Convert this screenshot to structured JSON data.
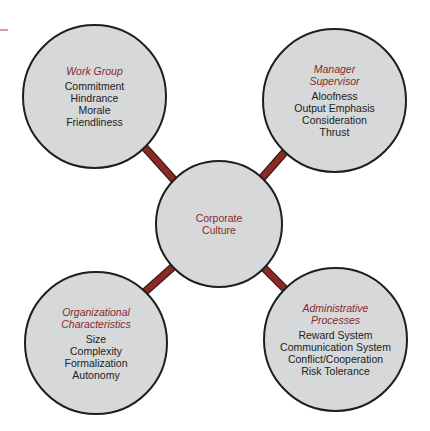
{
  "colors": {
    "connector": "#8b2a22",
    "circle_fill": "#d6d8da",
    "circle_border": "#1e1e1e",
    "title_text": "#8a2a2a",
    "item_text": "#222222"
  },
  "center": {
    "title_lines": [
      "Corporate",
      "Culture"
    ]
  },
  "nodes": {
    "work_group": {
      "title_lines": [
        "Work Group"
      ],
      "items": [
        "Commitment",
        "Hindrance",
        "Morale",
        "Friendliness"
      ]
    },
    "manager_supervisor": {
      "title_lines": [
        "Manager",
        "Supervisor"
      ],
      "items": [
        "Aloofness",
        "Output Emphasis",
        "Consideration",
        "Thrust"
      ]
    },
    "organizational_characteristics": {
      "title_lines": [
        "Organizational",
        "Characteristics"
      ],
      "items": [
        "Size",
        "Complexity",
        "Formalization",
        "Autonomy"
      ]
    },
    "administrative_processes": {
      "title_lines": [
        "Administrative",
        "Processes"
      ],
      "items": [
        "Reward System",
        "Communication System",
        "Conflict/Cooperation",
        "Risk Tolerance"
      ]
    }
  }
}
